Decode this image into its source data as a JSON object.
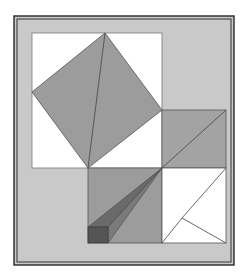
{
  "figure": {
    "type": "geometric-diagram",
    "colors": {
      "background": "#ffffff",
      "frame_fill": "#c9c9c9",
      "frame_border": "#333333",
      "white_region": "#ffffff",
      "gray_shape": "#9c9c9c",
      "dark_shape": "#6a6a6a",
      "darker_shape": "#555555",
      "line": "#444444"
    }
  }
}
